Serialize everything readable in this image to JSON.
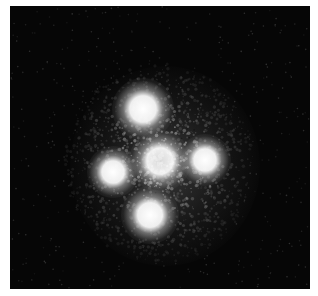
{
  "image": {
    "subject": "gravitational lens quadruple image (Einstein Cross)",
    "colors": {
      "background": "#ffffff",
      "sky": "#060606",
      "glow": "#ffffff"
    },
    "frame": {
      "x": 10,
      "y": 6,
      "width": 300,
      "height": 283
    },
    "sources": [
      {
        "name": "top",
        "cx": 143,
        "cy": 109,
        "r": 14
      },
      {
        "name": "left",
        "cx": 113,
        "cy": 172,
        "r": 12
      },
      {
        "name": "center",
        "cx": 160,
        "cy": 161,
        "r": 14
      },
      {
        "name": "right",
        "cx": 205,
        "cy": 160,
        "r": 12
      },
      {
        "name": "bottom",
        "cx": 150,
        "cy": 215,
        "r": 13
      }
    ]
  }
}
